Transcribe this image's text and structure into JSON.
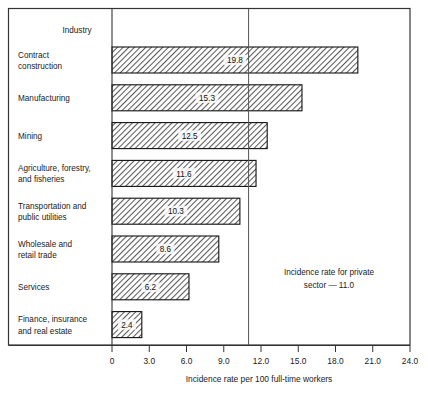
{
  "chart_data": {
    "type": "bar",
    "orientation": "horizontal",
    "title": "",
    "category_header": "Industry",
    "categories": [
      "Contract construction",
      "Manufacturing",
      "Mining",
      "Agriculture, forestry, and fisheries",
      "Transportation and public utilities",
      "Wholesale and retail trade",
      "Services",
      "Finance, insurance and real estate"
    ],
    "category_lines": [
      [
        "Contract",
        "construction"
      ],
      [
        "Manufacturing"
      ],
      [
        "Mining"
      ],
      [
        "Agriculture, forestry,",
        "and fisheries"
      ],
      [
        "Transportation and",
        "public utilities"
      ],
      [
        "Wholesale and",
        "retail trade"
      ],
      [
        "Services"
      ],
      [
        "Finance, insurance",
        "and real estate"
      ]
    ],
    "values": [
      19.8,
      15.3,
      12.5,
      11.6,
      10.3,
      8.6,
      6.2,
      2.4
    ],
    "value_labels": [
      "19.8",
      "15.3",
      "12.5",
      "11.6",
      "10.3",
      "8.6",
      "6.2",
      "2.4"
    ],
    "xlabel": "Incidence rate per 100 full-time workers",
    "ylabel": "",
    "xlim": [
      0,
      24.0
    ],
    "xticks": [
      0,
      3.0,
      6.0,
      9.0,
      12.0,
      15.0,
      18.0,
      21.0,
      24.0
    ],
    "xtick_labels": [
      "0",
      "3.0",
      "6.0",
      "9.0",
      "12.0",
      "15.0",
      "18.0",
      "21.0",
      "24.0"
    ],
    "grid": false,
    "legend": false,
    "reference_line": {
      "value": 11.0,
      "label_lines": [
        "Incidence rate for private",
        "sector — 11.0"
      ],
      "label_full": "Incidence rate for private sector — 11.0"
    },
    "bar_style": {
      "fill": "diagonal-hatch",
      "hatch_color": "#4a4a4a",
      "background": "#ffffff",
      "border": "#111111"
    }
  }
}
